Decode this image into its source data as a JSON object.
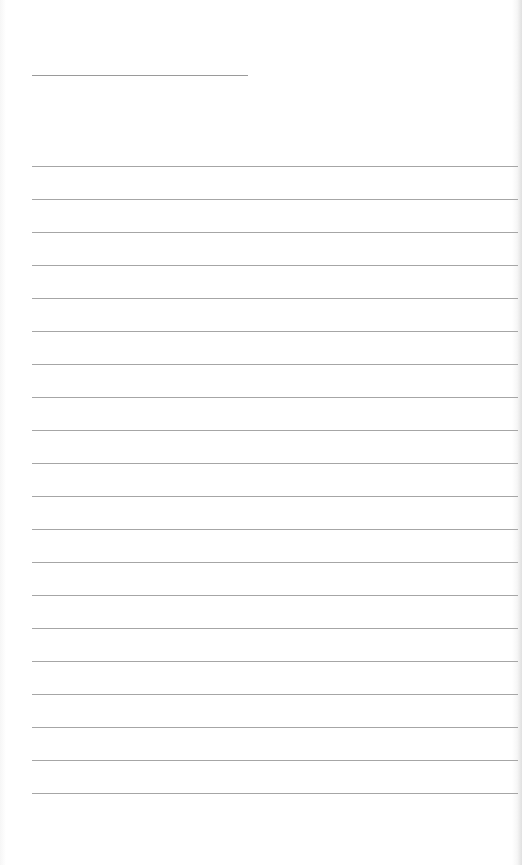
{
  "sheet": {
    "type": "ruled-writing-paper",
    "background_color": "#ffffff",
    "rule_color": "#a6a6a6",
    "title_line": {
      "x": 32,
      "y": 75,
      "width": 216
    },
    "rules": {
      "count": 20,
      "start_y": 166,
      "spacing": 33,
      "x": 32,
      "width": 486
    }
  }
}
